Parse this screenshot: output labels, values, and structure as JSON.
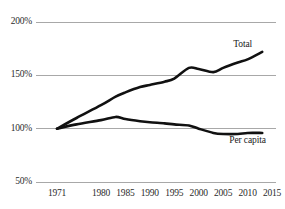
{
  "chart_data": {
    "type": "line",
    "title": "",
    "subtitle": "",
    "xlabel": "",
    "ylabel": "",
    "xlim": [
      1971,
      2015
    ],
    "ylim": [
      50,
      200
    ],
    "grid": "horizontal",
    "legend_position": "inline-right",
    "y_ticks": [
      "50%",
      "100%",
      "150%",
      "200%"
    ],
    "y_tick_values": [
      50,
      100,
      150,
      200
    ],
    "x_ticks": [
      "1971",
      "1980",
      "1985",
      "1990",
      "1995",
      "2000",
      "2005",
      "2010",
      "2015"
    ],
    "x_tick_values": [
      1971,
      1980,
      1985,
      1990,
      1995,
      2000,
      2005,
      2010,
      2015
    ],
    "series": [
      {
        "name": "Total",
        "color": "#111111",
        "x": [
          1971,
          1975,
          1980,
          1983,
          1985,
          1988,
          1990,
          1993,
          1995,
          1998,
          2000,
          2003,
          2005,
          2008,
          2010,
          2013
        ],
        "values": [
          100,
          110,
          122,
          130,
          134,
          139,
          141,
          144,
          147,
          157,
          156,
          153,
          157,
          162,
          165,
          172
        ]
      },
      {
        "name": "Per capita",
        "color": "#111111",
        "x": [
          1971,
          1975,
          1980,
          1983,
          1985,
          1988,
          1990,
          1993,
          1995,
          1998,
          2000,
          2003,
          2005,
          2008,
          2010,
          2013
        ],
        "values": [
          100,
          104,
          108,
          111,
          109,
          107,
          106,
          105,
          104,
          103,
          100,
          96,
          95,
          95,
          96,
          96
        ]
      }
    ],
    "annotations": [
      {
        "text": "Total",
        "x": 2009,
        "y": 178
      },
      {
        "text": "Per capita",
        "x": 2010,
        "y": 88
      }
    ]
  },
  "colors": {
    "background": "#ffffff",
    "gridline": "#a8a8a8",
    "line": "#111111",
    "tick_text": "#2b2b2b"
  }
}
